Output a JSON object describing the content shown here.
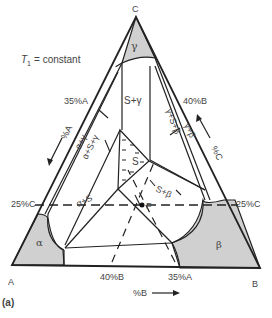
{
  "figure": {
    "panel_label": "(a)",
    "condition": {
      "symbol": "T",
      "subscript": "1",
      "text": "= constant"
    },
    "vertices": {
      "A": "A",
      "B": "B",
      "C": "C"
    },
    "phases": {
      "alpha": "α",
      "beta": "β",
      "gamma": "γ",
      "S": "S"
    },
    "regions": {
      "s_gamma": "S+γ",
      "alpha_gamma": "α+γ",
      "alpha_s_gamma": "α+S+γ",
      "gamma_s_beta": "γ+S+β",
      "gamma_beta": "γ+β",
      "alpha_s": "α+S",
      "s_beta": "S+β"
    },
    "point": "P",
    "edge_labels": {
      "a35_left": "35%A",
      "b40_right": "40%B",
      "c25_left": "25%C",
      "c25_right": "25%C",
      "b40_bottom": "40%B",
      "a35_bottom": "35%A"
    },
    "axis_labels": {
      "pct_a": "%A",
      "pct_b": "%B",
      "pct_c": "%C"
    },
    "colors": {
      "single_phase_fill": "#d0d0d0",
      "line": "#222222",
      "text": "#444444"
    }
  }
}
